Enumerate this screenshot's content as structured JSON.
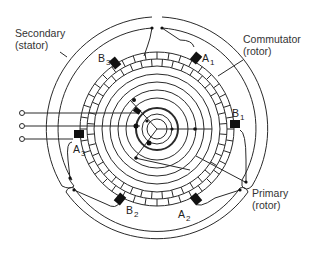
{
  "diagram": {
    "type": "induction-regulator-schematic",
    "labels": {
      "secondary_line1": "Secondary",
      "secondary_line2": "(stator)",
      "commutator_line1": "Commutator",
      "commutator_line2": "(rotor)",
      "primary_line1": "Primary",
      "primary_line2": "(rotor)"
    },
    "brushes": [
      {
        "id": "B3",
        "letter": "B",
        "sub": "3"
      },
      {
        "id": "A1",
        "letter": "A",
        "sub": "1"
      },
      {
        "id": "B1",
        "letter": "B",
        "sub": "1"
      },
      {
        "id": "A3",
        "letter": "A",
        "sub": "3"
      },
      {
        "id": "B2",
        "letter": "B",
        "sub": "2"
      },
      {
        "id": "A2",
        "letter": "A",
        "sub": "2"
      }
    ],
    "terminals": 3,
    "colors": {
      "line": "#2a2a2a",
      "brush": "#111111",
      "text": "#333333"
    }
  }
}
